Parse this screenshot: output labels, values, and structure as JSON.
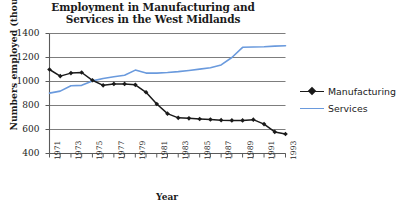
{
  "chart_data": {
    "type": "line",
    "title": "Employment in Manufacturing and Services in the West Midlands",
    "title_line1": "Employment in Manufacturing and",
    "title_line2": "Services in the West Midlands",
    "xlabel": "Year",
    "ylabel": "Numbers employed (thousands)",
    "ylim": [
      400,
      1400
    ],
    "ytick_labels": [
      "1400",
      "1200",
      "1000",
      "800",
      "600",
      "400"
    ],
    "ytick_values": [
      1400,
      1200,
      1000,
      800,
      600,
      400
    ],
    "xlim": [
      1971,
      1993
    ],
    "x": [
      1971,
      1972,
      1973,
      1974,
      1975,
      1976,
      1977,
      1978,
      1979,
      1980,
      1981,
      1982,
      1983,
      1984,
      1985,
      1986,
      1987,
      1988,
      1989,
      1990,
      1991,
      1992,
      1993
    ],
    "xtick_labels": [
      "1971",
      "",
      "1973",
      "",
      "1975",
      "",
      "1977",
      "",
      "1979",
      "",
      "1981",
      "",
      "1983",
      "",
      "1985",
      "",
      "1987",
      "",
      "1989",
      "",
      "1991",
      "",
      "1993"
    ],
    "xtick_labels_shown": [
      "1971",
      "1973",
      "1975",
      "1977",
      "1979",
      "1981",
      "1983",
      "1985",
      "1987",
      "1989",
      "1991",
      "1993"
    ],
    "grid": true,
    "grid_axis": "y",
    "legend_position": "right",
    "series": [
      {
        "name": "Manufacturing",
        "color": "#1a1a1a",
        "marker": "diamond",
        "values": [
          1100,
          1045,
          1070,
          1075,
          1010,
          968,
          980,
          980,
          972,
          910,
          812,
          732,
          697,
          693,
          688,
          683,
          678,
          676,
          676,
          682,
          645,
          580,
          562
        ]
      },
      {
        "name": "Services",
        "color": "#6a9add",
        "marker": "none",
        "values": [
          903,
          920,
          965,
          968,
          1005,
          1025,
          1040,
          1052,
          1095,
          1070,
          1070,
          1075,
          1082,
          1092,
          1103,
          1115,
          1138,
          1200,
          1285,
          1287,
          1290,
          1295,
          1298
        ]
      }
    ]
  },
  "legend": {
    "items": [
      {
        "label": "Manufacturing"
      },
      {
        "label": "Services"
      }
    ]
  }
}
